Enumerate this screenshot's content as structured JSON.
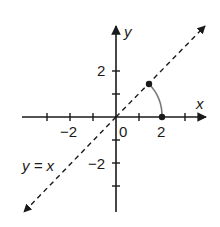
{
  "diagram": {
    "type": "coordinate-plane",
    "axes": {
      "x_label": "x",
      "y_label": "y",
      "x_ticks": [
        -3,
        -2,
        -1,
        0,
        1,
        2,
        3
      ],
      "y_ticks": [
        -3,
        -2,
        -1,
        1,
        2
      ],
      "x_tick_labels": [
        "−2",
        "0",
        "2"
      ],
      "y_tick_labels": [
        "2",
        "−2"
      ]
    },
    "line": {
      "equation_label": "y = x",
      "style": "dashed",
      "arrows": "both"
    },
    "points": [
      {
        "name": "point-on-line",
        "x": 1.414,
        "y": 1.414
      },
      {
        "name": "point-on-x-axis",
        "x": 2,
        "y": 0
      }
    ],
    "arc": {
      "description": "circular arc of radius 2 from (2,0) to (√2,√2)",
      "color": "#777777"
    },
    "colors": {
      "ink": "#1a1a1a",
      "arc": "#777777"
    }
  }
}
